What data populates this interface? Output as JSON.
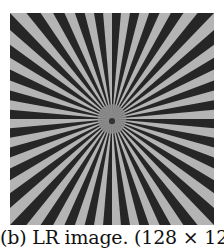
{
  "figure": {
    "panel_label": "(b)",
    "caption": "(b) LR image. (128 × 128)",
    "image": {
      "subject": "Siemens star test pattern",
      "description": "radial black and light-gray spokes converging to center, low resolution",
      "resolution": "128 × 128",
      "spokes": 36,
      "colors": {
        "dark": "#262626",
        "light": "#b4b4b4",
        "center": "#8c8c8c"
      }
    }
  }
}
